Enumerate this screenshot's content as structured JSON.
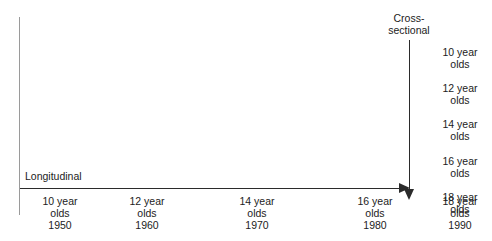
{
  "diagram": {
    "title_longitudinal": "Longitudinal",
    "title_cross_sectional_line1": "Cross-",
    "title_cross_sectional_line2": "sectional",
    "colors": {
      "text": "#1c1c1c",
      "arrow": "#2b2b2b",
      "frame_line": "#9a9a9a",
      "background": "#ffffff"
    },
    "bottom_axis_groups": [
      {
        "age": "10 year",
        "olds": "olds",
        "year": "1950",
        "left": 25
      },
      {
        "age": "12 year",
        "olds": "olds",
        "year": "1960",
        "left": 112
      },
      {
        "age": "14 year",
        "olds": "olds",
        "year": "1970",
        "left": 222
      },
      {
        "age": "16 year",
        "olds": "olds",
        "year": "1980",
        "left": 340
      },
      {
        "age": "18 year",
        "olds": "olds",
        "year": "1990",
        "left": 432
      }
    ],
    "side_axis_groups": [
      {
        "age": "10 year",
        "olds": "olds",
        "top": 46
      },
      {
        "age": "12 year",
        "olds": "olds",
        "top": 82
      },
      {
        "age": "14 year",
        "olds": "olds",
        "top": 118
      },
      {
        "age": "16 year",
        "olds": "olds",
        "top": 155
      },
      {
        "age": "18 year",
        "olds": "olds",
        "top": 191
      }
    ]
  }
}
